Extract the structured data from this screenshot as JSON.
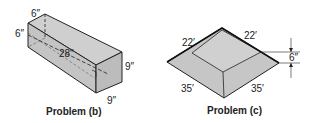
{
  "figures": [
    {
      "id": "b",
      "caption": "Problem (b)",
      "shape": "rectangular box (prism)",
      "labels": {
        "top_depth": "6″",
        "left_height": "6″",
        "length": "28″",
        "right_height": "9″",
        "bottom_width": "9″"
      }
    },
    {
      "id": "c",
      "caption": "Problem (c)",
      "shape": "truncated pyramid slab",
      "labels": {
        "top_left": "22′",
        "top_right": "22′",
        "bottom_left": "35′",
        "bottom_right": "35′",
        "height": "6″"
      }
    }
  ],
  "colors": {
    "fill": "#c8c8c8",
    "fill_light": "#d6d6d6",
    "line": "#222222"
  }
}
